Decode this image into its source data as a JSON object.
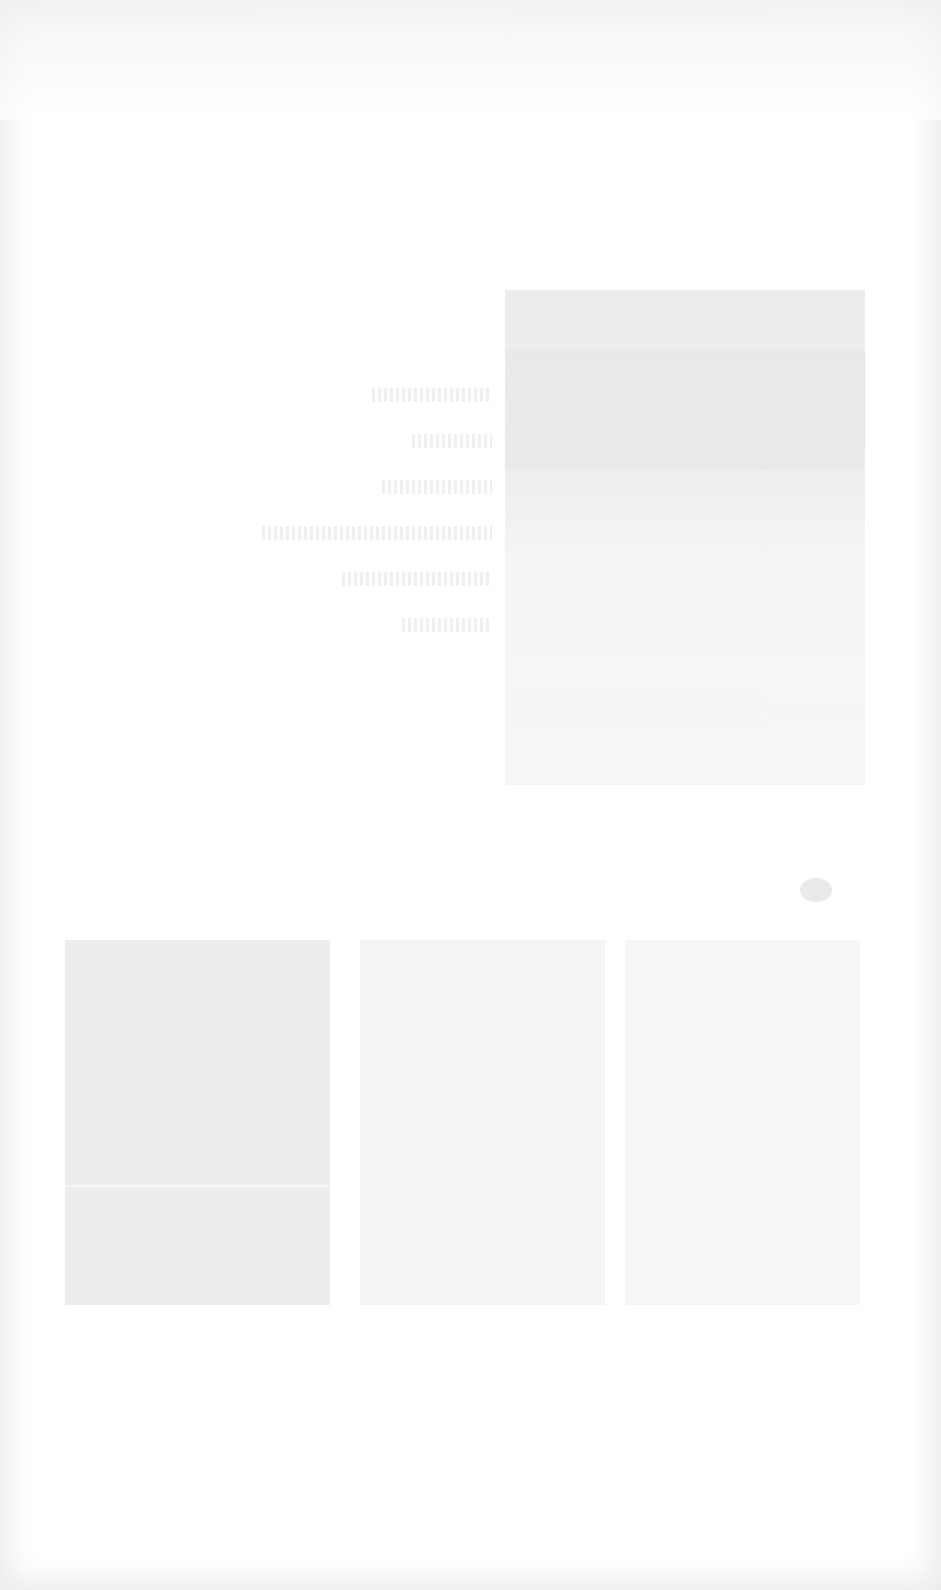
{
  "page": {
    "background": "#ffffff",
    "frame_tone": "#ececec",
    "legibility": "text illegible in source screenshot"
  },
  "text_column": {
    "lines": [
      "",
      "",
      "",
      "",
      "",
      ""
    ]
  },
  "hero_image": {
    "alt": "",
    "tone": "#ececec"
  },
  "gallery": {
    "tiles": [
      {
        "caption": "",
        "tone": "#ededed"
      },
      {
        "caption": "",
        "tone": "#f4f4f4"
      },
      {
        "caption": "",
        "tone": "#f6f6f6"
      }
    ]
  }
}
